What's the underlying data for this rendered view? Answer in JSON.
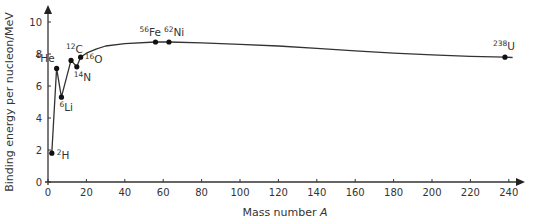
{
  "chart_data": {
    "type": "line",
    "title": "",
    "xlabel": "Mass number",
    "xlabel_italic_symbol": "A",
    "ylabel": "Binding energy per nucleon/MeV",
    "xlim": [
      0,
      245
    ],
    "ylim": [
      0,
      10.5
    ],
    "x_ticks": [
      0,
      20,
      40,
      60,
      80,
      100,
      120,
      140,
      160,
      180,
      200,
      220,
      240
    ],
    "y_ticks": [
      0,
      2,
      4,
      6,
      8,
      10
    ],
    "grid": false,
    "legend": null,
    "points": [
      {
        "label": "H",
        "mass": "2",
        "A": 2,
        "E": 1.8
      },
      {
        "label": "He",
        "mass": "4",
        "A": 4.5,
        "E": 7.1
      },
      {
        "label": "Li",
        "mass": "6",
        "A": 7,
        "E": 5.3
      },
      {
        "label": "C",
        "mass": "12",
        "A": 12,
        "E": 7.6
      },
      {
        "label": "N",
        "mass": "14",
        "A": 15,
        "E": 7.2
      },
      {
        "label": "O",
        "mass": "16",
        "A": 17,
        "E": 7.8
      },
      {
        "label": "Fe",
        "mass": "56",
        "A": 56,
        "E": 8.75
      },
      {
        "label": "Ni",
        "mass": "62",
        "A": 63,
        "E": 8.75
      },
      {
        "label": "U",
        "mass": "238",
        "A": 238,
        "E": 7.8
      }
    ],
    "curve": [
      [
        2,
        1.8
      ],
      [
        4.5,
        7.1
      ],
      [
        7,
        5.3
      ],
      [
        12,
        7.6
      ],
      [
        15,
        7.2
      ],
      [
        17,
        7.8
      ],
      [
        20,
        8.05
      ],
      [
        25,
        8.3
      ],
      [
        30,
        8.5
      ],
      [
        40,
        8.65
      ],
      [
        56,
        8.75
      ],
      [
        63,
        8.75
      ],
      [
        80,
        8.7
      ],
      [
        100,
        8.6
      ],
      [
        120,
        8.5
      ],
      [
        140,
        8.35
      ],
      [
        160,
        8.2
      ],
      [
        180,
        8.05
      ],
      [
        200,
        7.95
      ],
      [
        220,
        7.85
      ],
      [
        238,
        7.8
      ],
      [
        242,
        7.78
      ]
    ]
  }
}
